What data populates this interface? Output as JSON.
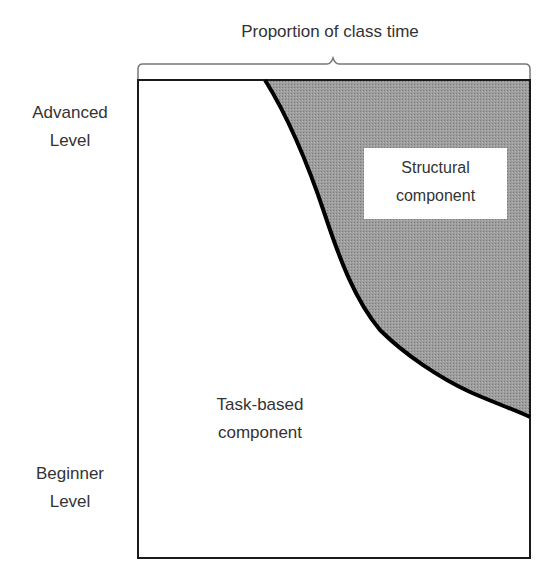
{
  "diagram": {
    "title": "Proportion of class time",
    "y_axis": {
      "top_label_line1": "Advanced",
      "top_label_line2": "Level",
      "bottom_label_line1": "Beginner",
      "bottom_label_line2": "Level"
    },
    "regions": {
      "task_based": {
        "line1": "Task-based",
        "line2": "component",
        "fill": "#ffffff"
      },
      "structural": {
        "line1": "Structural",
        "line2": "component",
        "fill": "#9a9a9a"
      }
    },
    "colors": {
      "frame": "#1a1a1a",
      "curve": "#000000",
      "brace": "#777777"
    }
  }
}
